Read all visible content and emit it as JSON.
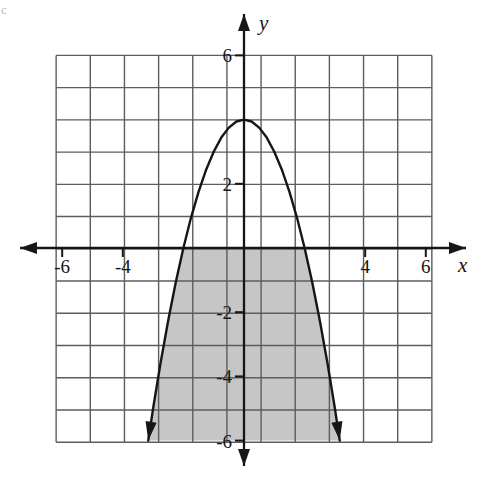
{
  "figure": {
    "kind": "cartesian-graph",
    "background_color": "#ffffff",
    "corner_mark": "c"
  },
  "chart_data": {
    "type": "line",
    "title": "",
    "subtitle": "",
    "xlabel": "x",
    "ylabel": "y",
    "xlim": [
      -6.6,
      6.6
    ],
    "ylim": [
      -6.6,
      6.6
    ],
    "grid": true,
    "grid_spacing": 1,
    "grid_color": "#5d5d5d",
    "grid_extent": {
      "x_min": -6.2,
      "x_max": 6.2,
      "y_min": -6.05,
      "y_max": 6.0
    },
    "legend": "none",
    "axis_color": "#161616",
    "curve_color": "#161616",
    "shade_color": "#c6c6c6",
    "x_ticks": [
      -6,
      -4,
      4,
      6
    ],
    "x_tick_labels": [
      "-6",
      "-4",
      "4",
      "6"
    ],
    "y_ticks": [
      6,
      2,
      -2,
      -4,
      -6
    ],
    "y_tick_labels": [
      "6",
      "2",
      "-2",
      "-4",
      "-6"
    ],
    "series": [
      {
        "name": "parabola",
        "equation": "y = 4 - x^2",
        "vertex": [
          0,
          4
        ],
        "roots": [
          -2,
          2
        ],
        "arrow_ends": [
          [
            -3.16,
            -6
          ],
          [
            3.16,
            -6
          ]
        ],
        "x": [
          -3.16,
          -3.0,
          -2.75,
          -2.5,
          -2.25,
          -2.0,
          -1.75,
          -1.5,
          -1.25,
          -1.0,
          -0.75,
          -0.5,
          -0.25,
          0,
          0.25,
          0.5,
          0.75,
          1.0,
          1.25,
          1.5,
          1.75,
          2.0,
          2.25,
          2.5,
          2.75,
          3.0,
          3.16
        ],
        "y": [
          -6.0,
          -5.0,
          -3.56,
          -2.25,
          -1.06,
          0,
          0.94,
          1.75,
          2.44,
          3.0,
          3.44,
          3.75,
          3.94,
          4.0,
          3.94,
          3.75,
          3.44,
          3.0,
          2.44,
          1.75,
          0.94,
          0,
          -1.06,
          -2.25,
          -3.56,
          -5.0,
          -6.0
        ]
      }
    ],
    "shaded_region": {
      "name": "region-between-parabola-and-y-minus-6",
      "description": "Region bounded above by the parabola (clipped at the x-axis) and below by y = -6",
      "upper_bound": 0,
      "lower_bound": -6
    },
    "annotations": []
  }
}
